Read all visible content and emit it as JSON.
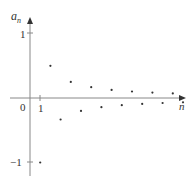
{
  "chart_data": {
    "type": "scatter",
    "title": "",
    "xlabel": "n",
    "ylabel": "a_n",
    "formula": "a_n = (-1)^n / n",
    "x": [
      1,
      2,
      3,
      4,
      5,
      6,
      7,
      8,
      9,
      10,
      11,
      12,
      13,
      14,
      15
    ],
    "values": [
      -1,
      0.5,
      -0.333,
      0.25,
      -0.2,
      0.167,
      -0.143,
      0.125,
      -0.111,
      0.1,
      -0.091,
      0.083,
      -0.077,
      0.071,
      -0.067
    ],
    "x_tick_labels": [
      "0",
      "1"
    ],
    "y_tick_labels": [
      "1",
      "-1"
    ],
    "ylim": [
      -1.2,
      1.2
    ],
    "grid": false,
    "legend": null,
    "colors": {
      "axis": "#888888",
      "points": "#333333",
      "text": "#333333"
    }
  },
  "labels": {
    "y_axis": "a",
    "y_axis_sub": "n",
    "x_axis": "n",
    "origin": "0",
    "x_tick_1": "1",
    "y_tick_1": "1",
    "y_tick_neg1": "−1"
  }
}
